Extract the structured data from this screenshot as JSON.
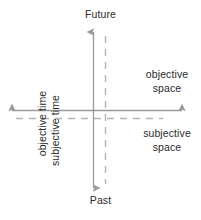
{
  "diagram": {
    "colors": {
      "text": "#2b2b2b",
      "solid_axis": "#9a9a9a",
      "dashed_axis": "#b0b0b0",
      "background": "#ffffff"
    },
    "labels": {
      "future": "Future",
      "past": "Past",
      "objective_time": "objective time",
      "subjective_time": "subjective time",
      "objective_space_line1": "objective",
      "objective_space_line2": "space",
      "subjective_space_line1": "subjective",
      "subjective_space_line2": "space"
    },
    "axes": [
      {
        "name": "objective-time-axis",
        "style": "solid",
        "orientation": "vertical",
        "label": "objective time",
        "positive_end": "Future",
        "negative_end": "Past",
        "arrowheads": "both"
      },
      {
        "name": "subjective-time-axis",
        "style": "dashed",
        "orientation": "vertical",
        "label": "subjective time",
        "arrowheads": "none"
      },
      {
        "name": "objective-space-axis",
        "style": "solid",
        "orientation": "horizontal",
        "label": "objective space",
        "arrowheads": "both"
      },
      {
        "name": "subjective-space-axis",
        "style": "dashed",
        "orientation": "horizontal",
        "label": "subjective space",
        "arrowheads": "none"
      }
    ]
  }
}
